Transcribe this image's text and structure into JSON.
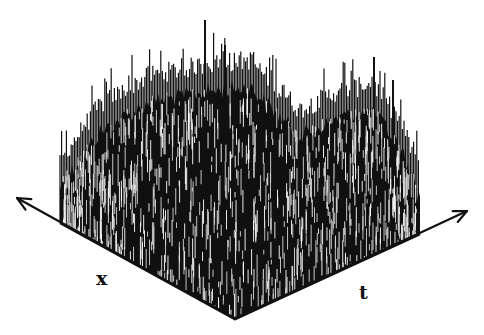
{
  "figure": {
    "type": "3d-spike-surface",
    "axes": {
      "x": {
        "label": "x",
        "direction": "back-left",
        "arrow": true
      },
      "t": {
        "label": "t",
        "direction": "back-right",
        "arrow": true
      }
    },
    "colors": {
      "background": "#ffffff",
      "ink": "#111111",
      "highlight": "#d8d8d8"
    },
    "geometry": {
      "origin": [
        235,
        319
      ],
      "x_axis_base_end": [
        60,
        223
      ],
      "x_axis_arrow_tip": [
        17,
        198
      ],
      "t_axis_base_end": [
        420,
        234
      ],
      "t_axis_arrow_tip": [
        467,
        211
      ]
    },
    "envelope": {
      "screen_x": [
        60,
        100,
        150,
        205,
        250,
        300,
        340,
        374,
        400,
        420
      ],
      "top_y": [
        170,
        115,
        85,
        75,
        70,
        120,
        100,
        95,
        130,
        180
      ]
    },
    "notable_peaks": [
      {
        "screen_x": 205,
        "top_y": 20
      },
      {
        "screen_x": 225,
        "top_y": 45
      },
      {
        "screen_x": 374,
        "top_y": 57
      },
      {
        "screen_x": 393,
        "top_y": 80
      }
    ]
  }
}
